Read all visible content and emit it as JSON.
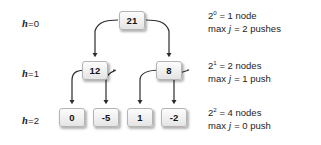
{
  "figure": {
    "background_color": "#ffffff"
  },
  "levels": [
    {
      "id": "level-0",
      "label_prefix": "h",
      "label_eq": "=",
      "label_value": "0"
    },
    {
      "id": "level-1",
      "label_prefix": "h",
      "label_eq": "=",
      "label_value": "1"
    },
    {
      "id": "level-2",
      "label_prefix": "h",
      "label_eq": "=",
      "label_value": "2"
    }
  ],
  "tree": {
    "root": {
      "value": "21"
    },
    "level1": [
      {
        "value": "12"
      },
      {
        "value": "8"
      }
    ],
    "level2": [
      {
        "value": "0"
      },
      {
        "value": "-5"
      },
      {
        "value": "1"
      },
      {
        "value": "-2"
      }
    ]
  },
  "notes": [
    {
      "id": "note-level-0",
      "power_base": "2",
      "power_exp": "0",
      "count_text": "= 1 node",
      "max_label": "max",
      "max_var": "j",
      "max_text": "= 2 pushes"
    },
    {
      "id": "note-level-1",
      "power_base": "2",
      "power_exp": "1",
      "count_text": "= 2 nodes",
      "max_label": "max",
      "max_var": "j",
      "max_text": "= 1 push"
    },
    {
      "id": "note-level-2",
      "power_base": "2",
      "power_exp": "2",
      "count_text": "= 4 nodes",
      "max_label": "max",
      "max_var": "j",
      "max_text": "= 0 push"
    }
  ],
  "style": {
    "edge_color": "#2b2b2b",
    "node_border": "#b4b4b4",
    "text_color": "#1d1d1d"
  }
}
